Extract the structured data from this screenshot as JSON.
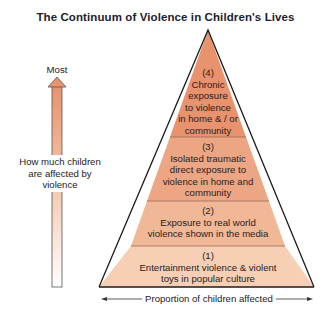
{
  "title": "The Continuum of Violence in Children's Lives",
  "vertical_axis": {
    "top_label": "Most",
    "label": "How much children are affected by violence",
    "label_lines": [
      "How much children",
      "are affected by",
      "violence"
    ],
    "arrow_direction": "up"
  },
  "horizontal_axis": {
    "label": "Proportion of children affected",
    "arrow_direction": "both"
  },
  "pyramid": {
    "tiers": [
      {
        "level": "(4)",
        "lines": [
          "Chronic",
          "exposure",
          "to violence",
          "in home & / or",
          "community"
        ],
        "text": "Chronic exposure to violence in home & / or community",
        "color": "#e8926e"
      },
      {
        "level": "(3)",
        "lines": [
          "Isolated traumatic",
          "direct exposure to",
          "violence in home and",
          "community"
        ],
        "text": "Isolated traumatic direct exposure to violence in home and community",
        "color": "#eda684"
      },
      {
        "level": "(2)",
        "lines": [
          "Exposure to real world",
          "violence shown in the media"
        ],
        "text": "Exposure to real world violence shown in the media",
        "color": "#f1b898"
      },
      {
        "level": "(1)",
        "lines": [
          "Entertainment violence & violent",
          "toys in popular culture"
        ],
        "text": "Entertainment violence & violent toys in popular culture",
        "color": "#f6cfb5"
      }
    ]
  },
  "colors": {
    "outline": "#1c1c1c",
    "arrow_top": "#e8926e",
    "arrow_bottom": "#ffffff",
    "title": "#1c1c2e"
  }
}
